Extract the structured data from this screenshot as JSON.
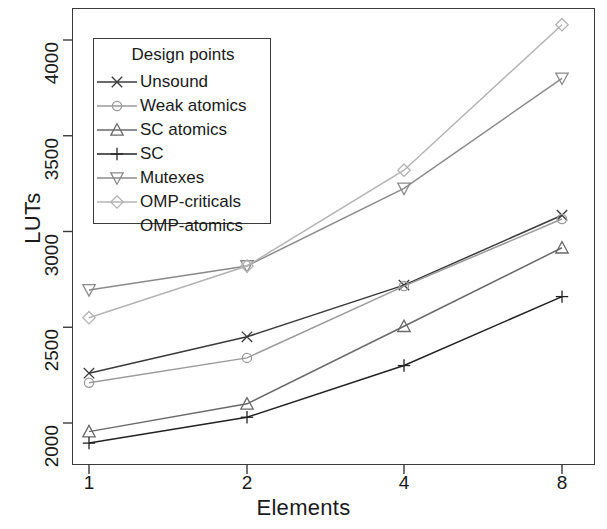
{
  "chart_data": {
    "type": "line",
    "title": "",
    "xlabel": "Elements",
    "ylabel": "LUTs",
    "x": [
      1,
      2,
      4,
      8
    ],
    "xtick_labels": [
      "1",
      "2",
      "4",
      "8"
    ],
    "ytick_labels": [
      "2000",
      "2500",
      "3000",
      "3500",
      "4000"
    ],
    "yticks": [
      2000,
      2500,
      3000,
      3500,
      4000
    ],
    "ylim": [
      1850,
      4150
    ],
    "grid": false,
    "legend_position": "top-left",
    "legend_title": "Design points",
    "series": [
      {
        "name": "Unsound",
        "marker": "x",
        "color": "#3b3b3b",
        "values": [
          2260,
          2450,
          2720,
          3085
        ]
      },
      {
        "name": "Weak atomics",
        "marker": "circle",
        "color": "#9a9a9a",
        "values": [
          2210,
          2340,
          2715,
          3065
        ]
      },
      {
        "name": "SC atomics",
        "marker": "triangle-up",
        "color": "#6a6a6a",
        "values": [
          1955,
          2100,
          2505,
          2915
        ]
      },
      {
        "name": "SC",
        "marker": "plus",
        "color": "#222222",
        "values": [
          1895,
          2030,
          2300,
          2660
        ]
      },
      {
        "name": "Mutexes",
        "marker": "triangle-down",
        "color": "#8a8a8a",
        "values": [
          2695,
          2820,
          3225,
          3800
        ]
      },
      {
        "name": "OMP-criticals",
        "marker": "diamond",
        "color": "#b4b4b4",
        "values": [
          2550,
          2820,
          3320,
          4080
        ]
      },
      {
        "name": "OMP-atomics",
        "marker": "none",
        "color": "#d8d8d8",
        "values": [
          null,
          null,
          null,
          null
        ]
      }
    ]
  },
  "axes": {
    "y_label": "LUTs",
    "x_label": "Elements",
    "y_ticks": [
      "2000",
      "2500",
      "3000",
      "3500",
      "4000"
    ],
    "x_ticks": [
      "1",
      "2",
      "4",
      "8"
    ]
  },
  "legend": {
    "title": "Design points",
    "items": [
      {
        "label": "Unsound",
        "icon": "legend-marker-x-icon"
      },
      {
        "label": "Weak atomics",
        "icon": "legend-marker-circle-icon"
      },
      {
        "label": "SC atomics",
        "icon": "legend-marker-triangle-up-icon"
      },
      {
        "label": "SC",
        "icon": "legend-marker-plus-icon"
      },
      {
        "label": "Mutexes",
        "icon": "legend-marker-triangle-down-icon"
      },
      {
        "label": "OMP-criticals",
        "icon": "legend-marker-diamond-icon"
      },
      {
        "label": "OMP-atomics",
        "icon": "legend-marker-none-icon"
      }
    ]
  }
}
